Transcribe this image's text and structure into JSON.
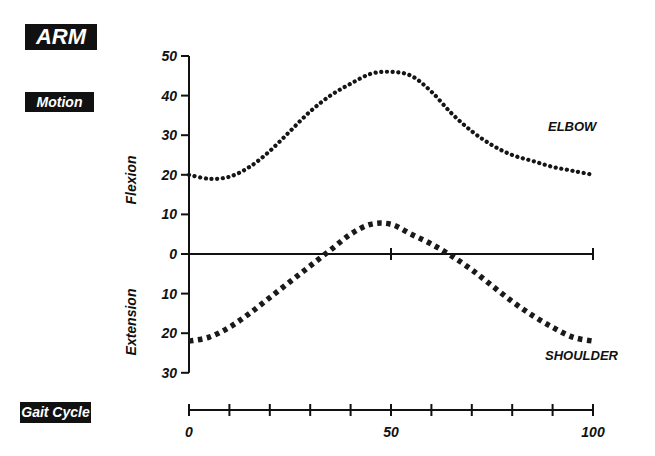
{
  "tags": {
    "title": "ARM",
    "subtitle": "Motion",
    "x_label": "Gait Cycle"
  },
  "chart_data": {
    "type": "line",
    "title": "ARM",
    "subtitle": "Motion",
    "xlabel": "Gait Cycle",
    "ylabel_positive": "Flexion",
    "ylabel_negative": "Extension",
    "xlim": [
      0,
      100
    ],
    "ylim": [
      -30,
      50
    ],
    "x_ticks": [
      0,
      10,
      20,
      30,
      40,
      50,
      60,
      70,
      80,
      90,
      100
    ],
    "x_tick_labels": [
      {
        "value": 0,
        "label": "0"
      },
      {
        "value": 50,
        "label": "50"
      },
      {
        "value": 100,
        "label": "100"
      }
    ],
    "y_tick_labels": [
      {
        "value": 50,
        "label": "50"
      },
      {
        "value": 40,
        "label": "40"
      },
      {
        "value": 30,
        "label": "30"
      },
      {
        "value": 20,
        "label": "20"
      },
      {
        "value": 10,
        "label": "10"
      },
      {
        "value": 0,
        "label": "0"
      },
      {
        "value": -10,
        "label": "10"
      },
      {
        "value": -20,
        "label": "20"
      },
      {
        "value": -30,
        "label": "30"
      }
    ],
    "zero_line_ticks": [
      50,
      100
    ],
    "grid": false,
    "series": [
      {
        "name": "ELBOW",
        "style": "dotted-round",
        "x": [
          0,
          5,
          10,
          15,
          20,
          25,
          30,
          35,
          40,
          45,
          50,
          55,
          60,
          65,
          70,
          75,
          80,
          85,
          90,
          95,
          100
        ],
        "values": [
          20,
          19,
          19.5,
          22,
          26,
          31,
          36,
          40,
          43,
          45.5,
          46,
          45,
          41,
          35.5,
          31,
          27.5,
          25,
          23.5,
          22,
          21,
          20
        ]
      },
      {
        "name": "SHOULDER",
        "style": "dotted-square",
        "x": [
          0,
          5,
          10,
          15,
          20,
          25,
          30,
          35,
          40,
          45,
          50,
          55,
          60,
          65,
          70,
          75,
          80,
          85,
          90,
          95,
          100
        ],
        "values": [
          -22,
          -21,
          -18.5,
          -15,
          -11,
          -7,
          -3,
          1,
          5,
          7.5,
          7.5,
          5,
          2.5,
          -0.5,
          -4,
          -8,
          -12,
          -15.5,
          -18.5,
          -21,
          -22
        ]
      }
    ]
  }
}
